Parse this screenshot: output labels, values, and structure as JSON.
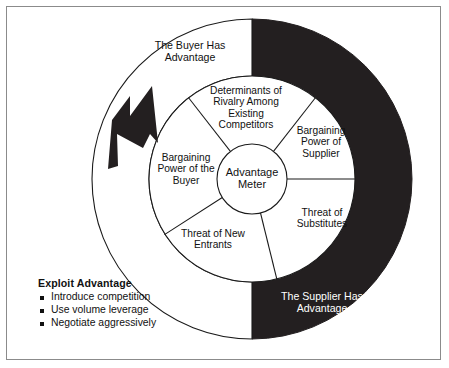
{
  "diagram": {
    "hub": {
      "label": "Advantage\nMeter"
    },
    "wedges": [
      {
        "id": "rivalry",
        "label": "Determinants of\nRivalry Among\nExisting\nCompetitors"
      },
      {
        "id": "supplier-power",
        "label": "Bargaining\nPower of\nSupplier"
      },
      {
        "id": "substitutes",
        "label": "Threat of\nSubstitutes"
      },
      {
        "id": "new-entrants",
        "label": "Threat of New\nEntrants"
      },
      {
        "id": "buyer-power",
        "label": "Bargaining\nPower of the\nBuyer"
      }
    ],
    "ring": {
      "buyer_side": {
        "label": "The Buyer Has\nAdvantage",
        "fill": "#ffffff",
        "text_color": "#111111"
      },
      "supplier_side": {
        "label": "The Supplier Has\nAdvantage",
        "fill": "#231f20",
        "text_color": "#ffffff"
      }
    },
    "arrow": {
      "name": "advantage-arrow",
      "direction": "up-left",
      "fill": "#231f20"
    }
  },
  "legend": {
    "title": "Exploit Advantage",
    "items": [
      "Introduce\ncompetition",
      "Use volume leverage",
      "Negotiate aggressively"
    ]
  },
  "colors": {
    "ink": "#111111",
    "black_fill": "#231f20",
    "frame": "#8b8b8b",
    "paper": "#ffffff"
  }
}
